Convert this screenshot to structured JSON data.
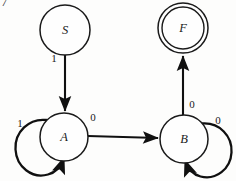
{
  "figure": {
    "kind": "finite-state-automaton",
    "page_number": "7",
    "background_color": "#fdfdfc",
    "ink_color": "#101010"
  },
  "states": [
    {
      "id": "S",
      "label": "S",
      "role": "start",
      "accepting": false,
      "cx": 65,
      "cy": 30,
      "r": 25
    },
    {
      "id": "F",
      "label": "F",
      "role": "final",
      "accepting": true,
      "cx": 183,
      "cy": 28,
      "r": 25,
      "inner_r": 21
    },
    {
      "id": "A",
      "label": "A",
      "role": "normal",
      "accepting": false,
      "cx": 64,
      "cy": 137,
      "r": 24
    },
    {
      "id": "B",
      "label": "B",
      "role": "normal",
      "accepting": false,
      "cx": 184,
      "cy": 139,
      "r": 24
    }
  ],
  "transitions": [
    {
      "from": "S",
      "to": "A",
      "symbol": "1",
      "kind": "straight",
      "label_x": 54,
      "label_y": 58
    },
    {
      "from": "A",
      "to": "B",
      "symbol": "0",
      "kind": "straight",
      "label_x": 93,
      "label_y": 117
    },
    {
      "from": "B",
      "to": "F",
      "symbol": "0",
      "kind": "straight",
      "label_x": 192,
      "label_y": 104
    },
    {
      "from": "A",
      "to": "A",
      "symbol": "1",
      "kind": "self-loop",
      "loop_side": "lower-left",
      "label_x": 20,
      "label_y": 123
    },
    {
      "from": "B",
      "to": "B",
      "symbol": "0",
      "kind": "self-loop",
      "loop_side": "lower-right",
      "label_x": 218,
      "label_y": 120
    }
  ]
}
